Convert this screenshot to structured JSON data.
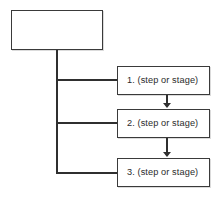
{
  "diagram": {
    "type": "flowchart",
    "title": "",
    "root": {
      "label": "",
      "empty": true
    },
    "steps": [
      {
        "label": "1. (step or stage)"
      },
      {
        "label": "2. (step or stage)"
      },
      {
        "label": "3. (step or stage)"
      }
    ],
    "connectors": {
      "trunk": "vertical-spine-from-root",
      "branches": [
        "branch-to-step-1",
        "branch-to-step-2",
        "branch-to-step-3"
      ],
      "sequence_arrows": [
        "step-1-to-step-2",
        "step-2-to-step-3"
      ]
    },
    "colors": {
      "background": "#ffffff",
      "box_fill": "#ffffff",
      "box_border": "#3a3a3a",
      "line": "#2f2f2f",
      "text": "#2b2b2b"
    }
  }
}
